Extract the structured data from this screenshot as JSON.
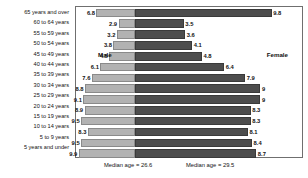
{
  "chart_data": {
    "type": "bar",
    "subtype": "population-pyramid",
    "title": "",
    "xlabel": "",
    "ylabel": "",
    "categories": [
      "65 years and over",
      "60 to 64 years",
      "55 to 59 years",
      "50 to 54 years",
      "45 to 49 years",
      "40 to 44 years",
      "35 to 39 years",
      "30 to 34 years",
      "25 to 29 years",
      "20 to 24 years",
      "15 to 19 years",
      "10 to 14 years",
      "5 to 9 years",
      "5 years and under"
    ],
    "series": [
      {
        "name": "Male",
        "direction": "left",
        "color": "#b2b2b2",
        "values": [
          6.8,
          2.9,
          3.2,
          3.8,
          4.5,
          6.1,
          7.6,
          8.8,
          9.1,
          8.9,
          9.5,
          8.3,
          9.5,
          9.9
        ]
      },
      {
        "name": "Female",
        "direction": "right",
        "color": "#4d4d4d",
        "values": [
          9.8,
          3.5,
          3.6,
          4.1,
          4.8,
          6.4,
          7.9,
          9,
          9,
          8.3,
          8.3,
          8.1,
          8.4,
          8.7
        ]
      }
    ],
    "xlim": [
      0,
      10.4
    ],
    "grid": false,
    "legend": "inline",
    "annotations": [
      "Median age = 26.6",
      "Median age = 29.5"
    ]
  },
  "captions": {
    "male": "Male",
    "female": "Female"
  },
  "footnotes": {
    "median_male": "Median age = 26.6",
    "median_female": "Median age = 29.5"
  }
}
